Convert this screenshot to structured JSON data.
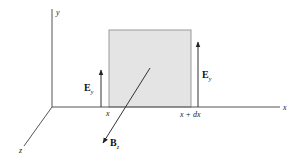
{
  "diagram": {
    "axes": {
      "x_label": "x",
      "y_label": "y",
      "z_label": "z"
    },
    "slab": {
      "fill": "#e4e4e4",
      "stroke": "#999999"
    },
    "markers": {
      "left_x": "x",
      "right_x": "x + dx"
    },
    "vectors": {
      "E_left": {
        "symbol": "E",
        "subscript": "y"
      },
      "E_right": {
        "symbol": "E",
        "subscript": "y"
      },
      "B": {
        "symbol": "B",
        "subscript": "z"
      }
    }
  }
}
